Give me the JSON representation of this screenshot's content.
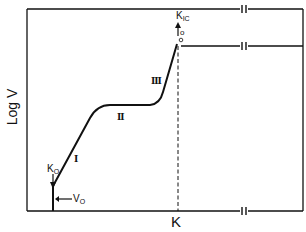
{
  "diagram": {
    "type": "crack-growth-rate-schematic",
    "axes": {
      "xlabel": "K",
      "ylabel": "Log V"
    },
    "regions": [
      {
        "id": "I",
        "label": "I"
      },
      {
        "id": "II",
        "label": "II"
      },
      {
        "id": "III",
        "label": "III"
      }
    ],
    "annotations": {
      "k_threshold": {
        "main": "K",
        "sub": "O"
      },
      "v_threshold": {
        "main": "V",
        "sub": "O"
      },
      "k_ic": {
        "main": "K",
        "sub": "IC"
      },
      "k_ic_marker": "o"
    },
    "colors": {
      "line": "#111111",
      "background": "#ffffff"
    }
  }
}
